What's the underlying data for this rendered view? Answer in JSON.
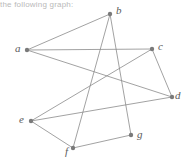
{
  "figure": {
    "caption_fragment": "the following graph:",
    "background_color": "#ffffff",
    "width": 185,
    "height": 165
  },
  "graph": {
    "edge_color": "#8a8a8a",
    "node_color": "#7a7a7a",
    "label_color": "#5b5b5b",
    "node_radius": 2.2,
    "edge_width": 0.8,
    "nodes": [
      {
        "id": "a",
        "label": "a",
        "x": 27,
        "y": 50,
        "label_x": 15,
        "label_y": 43
      },
      {
        "id": "b",
        "label": "b",
        "x": 110,
        "y": 14,
        "label_x": 116,
        "label_y": 5
      },
      {
        "id": "c",
        "label": "c",
        "x": 152,
        "y": 49,
        "label_x": 158,
        "label_y": 41
      },
      {
        "id": "d",
        "label": "d",
        "x": 172,
        "y": 97,
        "label_x": 175,
        "label_y": 90
      },
      {
        "id": "e",
        "label": "e",
        "x": 31,
        "y": 121,
        "label_x": 19,
        "label_y": 114
      },
      {
        "id": "f",
        "label": "f",
        "x": 73,
        "y": 148,
        "label_x": 65,
        "label_y": 146
      },
      {
        "id": "g",
        "label": "g",
        "x": 131,
        "y": 135,
        "label_x": 137,
        "label_y": 129
      }
    ],
    "edges": [
      {
        "from": "a",
        "to": "b"
      },
      {
        "from": "a",
        "to": "c"
      },
      {
        "from": "a",
        "to": "d"
      },
      {
        "from": "b",
        "to": "f"
      },
      {
        "from": "b",
        "to": "g"
      },
      {
        "from": "c",
        "to": "d"
      },
      {
        "from": "c",
        "to": "e"
      },
      {
        "from": "d",
        "to": "e"
      },
      {
        "from": "e",
        "to": "f"
      },
      {
        "from": "f",
        "to": "g"
      }
    ]
  }
}
